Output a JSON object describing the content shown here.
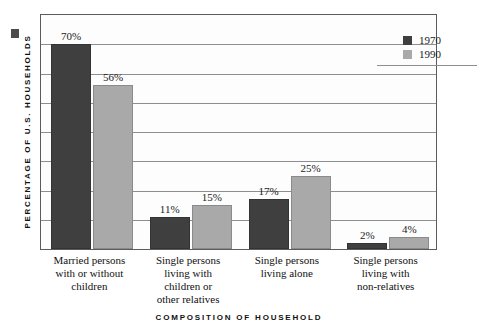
{
  "chart_data": {
    "type": "bar",
    "title": "",
    "xlabel": "COMPOSITION OF HOUSEHOLD",
    "ylabel": "PERCENTAGE OF U.S. HOUSEHOLDS",
    "ylim": [
      0,
      80
    ],
    "grid": true,
    "gridline_step": 10,
    "tick_labels_visible": false,
    "legend_position": "top-right",
    "categories": [
      "Married persons with or without children",
      "Single persons living with children or other relatives",
      "Single persons living alone",
      "Single persons living with non-relatives"
    ],
    "category_lines": [
      [
        "Married persons",
        "with or without",
        "children"
      ],
      [
        "Single persons",
        "living with",
        "children or",
        "other relatives"
      ],
      [
        "Single persons",
        "living alone"
      ],
      [
        "Single persons",
        "living with",
        "non-relatives"
      ]
    ],
    "series": [
      {
        "name": "1970",
        "color": "#3f3f3f",
        "values": [
          70,
          11,
          17,
          2
        ],
        "labels": [
          "70%",
          "11%",
          "17%",
          "2%"
        ]
      },
      {
        "name": "1990",
        "color": "#a9a9a9",
        "values": [
          56,
          15,
          25,
          4
        ],
        "labels": [
          "56%",
          "15%",
          "25%",
          "4%"
        ]
      }
    ]
  },
  "legend": {
    "entries": [
      {
        "label": "1970",
        "color": "#3f3f3f"
      },
      {
        "label": "1990",
        "color": "#a9a9a9"
      }
    ]
  },
  "axes": {
    "y_title": "PERCENTAGE OF U.S. HOUSEHOLDS",
    "x_title": "COMPOSITION OF HOUSEHOLD"
  },
  "colors": {
    "series_1970": "#3f3f3f",
    "series_1990": "#a9a9a9",
    "gridline": "#8e8e8e",
    "border": "#5b5b5b",
    "plot_background": "#fdfdfd",
    "page_background": "#ffffff"
  }
}
